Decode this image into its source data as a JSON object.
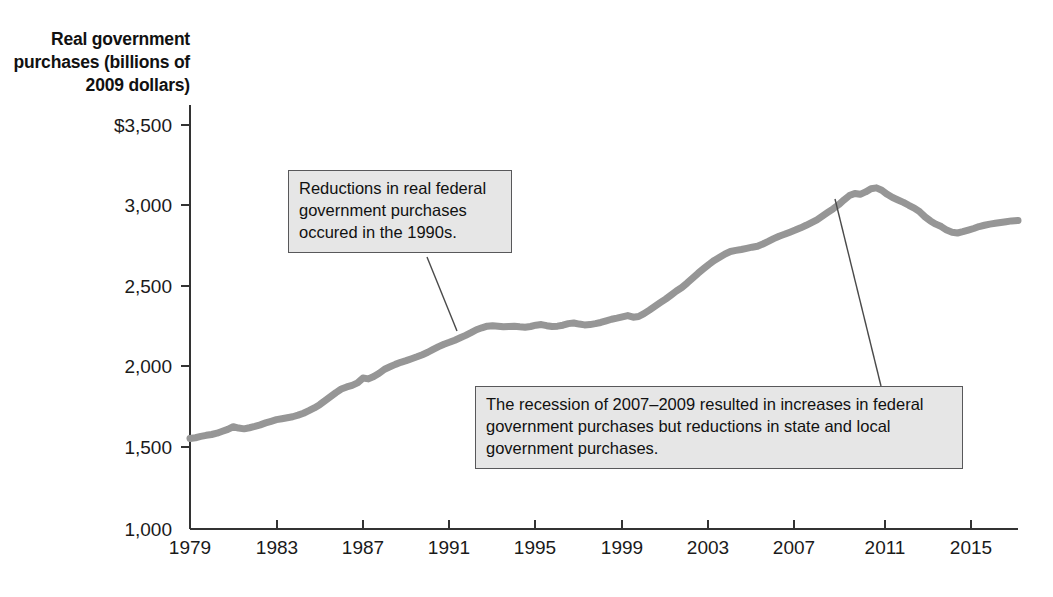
{
  "chart_data": {
    "type": "line",
    "title": "",
    "ylabel": "Real government purchases (billions of 2009 dollars)",
    "xlabel": "",
    "ylim": [
      1000,
      3500
    ],
    "xlim": [
      1979,
      2017.3
    ],
    "grid": false,
    "legend": "none",
    "line_color": "#969696",
    "y_ticks": [
      "$3,500",
      "3,000",
      "2,500",
      "2,000",
      "1,500",
      "1,000"
    ],
    "y_tick_values": [
      3500,
      3000,
      2500,
      2000,
      1500,
      1000
    ],
    "x_ticks": [
      "1979",
      "1983",
      "1987",
      "1991",
      "1995",
      "1999",
      "2003",
      "2007",
      "2011",
      "2015"
    ],
    "x_tick_values": [
      1979,
      1983,
      1987,
      1991,
      1995,
      1999,
      2003,
      2007,
      2011,
      2015
    ],
    "series": [
      {
        "name": "Real government purchases",
        "x": [
          1979.0,
          1979.25,
          1979.5,
          1979.75,
          1980.0,
          1980.25,
          1980.5,
          1980.75,
          1981.0,
          1981.25,
          1981.5,
          1981.75,
          1982.0,
          1982.25,
          1982.5,
          1982.75,
          1983.0,
          1983.25,
          1983.5,
          1983.75,
          1984.0,
          1984.25,
          1984.5,
          1984.75,
          1985.0,
          1985.25,
          1985.5,
          1985.75,
          1986.0,
          1986.25,
          1986.5,
          1986.75,
          1987.0,
          1987.25,
          1987.5,
          1987.75,
          1988.0,
          1988.25,
          1988.5,
          1988.75,
          1989.0,
          1989.25,
          1989.5,
          1989.75,
          1990.0,
          1990.25,
          1990.5,
          1990.75,
          1991.0,
          1991.25,
          1991.5,
          1991.75,
          1992.0,
          1992.25,
          1992.5,
          1992.75,
          1993.0,
          1993.25,
          1993.5,
          1993.75,
          1994.0,
          1994.25,
          1994.5,
          1994.75,
          1995.0,
          1995.25,
          1995.5,
          1995.75,
          1996.0,
          1996.25,
          1996.5,
          1996.75,
          1997.0,
          1997.25,
          1997.5,
          1997.75,
          1998.0,
          1998.25,
          1998.5,
          1998.75,
          1999.0,
          1999.25,
          1999.5,
          1999.75,
          2000.0,
          2000.25,
          2000.5,
          2000.75,
          2001.0,
          2001.25,
          2001.5,
          2001.75,
          2002.0,
          2002.25,
          2002.5,
          2002.75,
          2003.0,
          2003.25,
          2003.5,
          2003.75,
          2004.0,
          2004.25,
          2004.5,
          2004.75,
          2005.0,
          2005.25,
          2005.5,
          2005.75,
          2006.0,
          2006.25,
          2006.5,
          2006.75,
          2007.0,
          2007.25,
          2007.5,
          2007.75,
          2008.0,
          2008.25,
          2008.5,
          2008.75,
          2009.0,
          2009.25,
          2009.5,
          2009.75,
          2010.0,
          2010.25,
          2010.5,
          2010.75,
          2011.0,
          2011.25,
          2011.5,
          2011.75,
          2012.0,
          2012.25,
          2012.5,
          2012.75,
          2013.0,
          2013.25,
          2013.5,
          2013.75,
          2014.0,
          2014.25,
          2014.5,
          2014.75,
          2015.0,
          2015.25,
          2015.5,
          2015.75,
          2016.0,
          2016.25,
          2016.5,
          2016.75,
          2017.0,
          2017.3
        ],
        "values": [
          1555,
          1560,
          1568,
          1575,
          1580,
          1588,
          1600,
          1612,
          1628,
          1620,
          1615,
          1622,
          1630,
          1640,
          1652,
          1662,
          1672,
          1678,
          1684,
          1690,
          1700,
          1712,
          1728,
          1745,
          1765,
          1790,
          1815,
          1840,
          1862,
          1875,
          1885,
          1900,
          1930,
          1925,
          1940,
          1960,
          1985,
          2000,
          2015,
          2028,
          2038,
          2050,
          2062,
          2075,
          2090,
          2108,
          2125,
          2140,
          2152,
          2165,
          2180,
          2195,
          2212,
          2230,
          2242,
          2252,
          2255,
          2252,
          2248,
          2250,
          2252,
          2248,
          2245,
          2250,
          2258,
          2262,
          2255,
          2250,
          2252,
          2258,
          2268,
          2272,
          2265,
          2260,
          2262,
          2268,
          2275,
          2285,
          2295,
          2302,
          2310,
          2318,
          2308,
          2312,
          2330,
          2352,
          2375,
          2398,
          2420,
          2445,
          2470,
          2492,
          2520,
          2550,
          2580,
          2608,
          2635,
          2660,
          2680,
          2700,
          2715,
          2722,
          2728,
          2735,
          2742,
          2748,
          2762,
          2778,
          2795,
          2810,
          2822,
          2835,
          2848,
          2862,
          2878,
          2895,
          2912,
          2935,
          2958,
          2980,
          3005,
          3035,
          3062,
          3075,
          3070,
          3085,
          3105,
          3110,
          3095,
          3070,
          3050,
          3035,
          3020,
          3002,
          2985,
          2962,
          2930,
          2905,
          2885,
          2870,
          2848,
          2835,
          2830,
          2838,
          2848,
          2858,
          2870,
          2878,
          2885,
          2890,
          2895,
          2900,
          2905,
          2908
        ]
      }
    ],
    "annotations": [
      {
        "id": "anno-1990s",
        "text": "Reductions in real federal government purchases occured in the 1990s.",
        "leader_from": [
          427,
          257
        ],
        "leader_to": [
          457,
          331
        ]
      },
      {
        "id": "anno-recession",
        "text": "The recession of 2007–2009 resulted in increases in federal government purchases but reductions in state and local government purchases.",
        "leader_from": [
          835,
          199
        ],
        "leader_to": [
          881,
          386
        ]
      }
    ]
  }
}
